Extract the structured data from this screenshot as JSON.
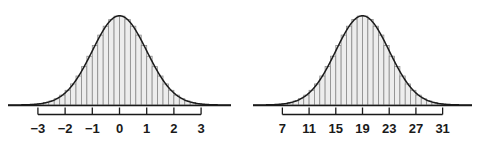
{
  "figure": {
    "title": "",
    "background": "#ffffff",
    "panel_count": 2
  },
  "style": {
    "bar_fill": "#ededed",
    "bar_stroke": "#8a8a8a",
    "curve_stroke": "#1a1a1a",
    "axis_stroke": "#1a1a1a",
    "label_color": "#1a1a1a"
  },
  "chart_data": [
    {
      "type": "histogram",
      "name": "standard-normal-z-scale",
      "title": "",
      "subtitle": "",
      "xlabel": "",
      "ylabel": "",
      "grid": false,
      "legend": null,
      "axis_line_range": [
        -4.1,
        4.1
      ],
      "xlim": [
        -4.1,
        4.1
      ],
      "ylim": [
        0,
        0.42
      ],
      "tick_values": [
        -3,
        -2,
        -1,
        0,
        1,
        2,
        3
      ],
      "tick_labels": [
        "−3",
        "−2",
        "−1",
        "0",
        "1",
        "2",
        "3"
      ],
      "mean": 0,
      "sd": 1,
      "bin_width": 0.2,
      "bin_centers": [
        -3.3,
        -3.1,
        -2.9,
        -2.7,
        -2.5,
        -2.3,
        -2.1,
        -1.9,
        -1.7,
        -1.5,
        -1.3,
        -1.1,
        -0.9,
        -0.7,
        -0.5,
        -0.3,
        -0.1,
        0.1,
        0.3,
        0.5,
        0.7,
        0.9,
        1.1,
        1.3,
        1.5,
        1.7,
        1.9,
        2.1,
        2.3,
        2.5,
        2.7,
        2.9,
        3.1,
        3.3
      ],
      "bin_heights": [
        0.0017,
        0.0033,
        0.006,
        0.0104,
        0.0175,
        0.0283,
        0.044,
        0.0656,
        0.094,
        0.1295,
        0.1714,
        0.2179,
        0.2661,
        0.3123,
        0.3521,
        0.3814,
        0.397,
        0.397,
        0.3814,
        0.3521,
        0.3123,
        0.2661,
        0.2179,
        0.1714,
        0.1295,
        0.094,
        0.0656,
        0.044,
        0.0283,
        0.0175,
        0.0104,
        0.006,
        0.0033,
        0.0017
      ],
      "curve": "normal-density"
    },
    {
      "type": "histogram",
      "name": "normal-raw-scale",
      "title": "",
      "subtitle": "",
      "xlabel": "",
      "ylabel": "",
      "grid": false,
      "legend": null,
      "axis_line_range": [
        2.6,
        35.4
      ],
      "xlim": [
        2.6,
        35.4
      ],
      "ylim": [
        0,
        0.105
      ],
      "tick_values": [
        7,
        11,
        15,
        19,
        23,
        27,
        31
      ],
      "tick_labels": [
        "7",
        "11",
        "15",
        "19",
        "23",
        "27",
        "31"
      ],
      "mean": 19,
      "sd": 4,
      "bin_width": 0.8,
      "bin_centers": [
        5.8,
        6.6,
        7.4,
        8.2,
        9.0,
        9.8,
        10.6,
        11.4,
        12.2,
        13.0,
        13.8,
        14.6,
        15.4,
        16.2,
        17.0,
        17.8,
        18.6,
        19.4,
        20.2,
        21.0,
        21.8,
        22.6,
        23.4,
        24.2,
        25.0,
        25.8,
        26.6,
        27.4,
        28.2,
        29.0,
        29.8,
        30.6,
        31.4,
        32.2
      ],
      "bin_heights": [
        0.00042,
        0.00083,
        0.0015,
        0.0026,
        0.0044,
        0.0071,
        0.011,
        0.0164,
        0.0235,
        0.0324,
        0.0429,
        0.0545,
        0.0665,
        0.0781,
        0.088,
        0.0954,
        0.0993,
        0.0993,
        0.0954,
        0.088,
        0.0781,
        0.0665,
        0.0545,
        0.0429,
        0.0324,
        0.0235,
        0.0164,
        0.011,
        0.0071,
        0.0044,
        0.0026,
        0.0015,
        0.00083,
        0.00042
      ],
      "curve": "normal-density"
    }
  ]
}
